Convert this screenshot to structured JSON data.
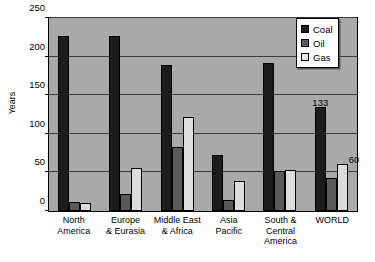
{
  "chart_data": {
    "type": "bar",
    "title": "",
    "xlabel": "",
    "ylabel": "Years",
    "ylim": [
      0,
      250
    ],
    "yticks": [
      0,
      50,
      100,
      150,
      200,
      250
    ],
    "grid": true,
    "legend_position": "top-right",
    "categories": [
      "North America",
      "Europe & Eurasia",
      "Middle East & Africa",
      "Asia Pacific",
      "South & Central America",
      "WORLD"
    ],
    "category_lines": [
      [
        "North",
        "America"
      ],
      [
        "Europe",
        "& Eurasia"
      ],
      [
        "Middle East",
        "& Africa"
      ],
      [
        "Asia",
        "Pacific"
      ],
      [
        "South &",
        "Central",
        "America"
      ],
      [
        "WORLD"
      ]
    ],
    "series": [
      {
        "name": "Coal",
        "color": "#1c1c1c",
        "values": [
          225,
          225,
          187,
          72,
          190,
          133
        ],
        "labels": [
          "",
          "",
          "",
          "",
          "",
          "133"
        ]
      },
      {
        "name": "Oil",
        "color": "#595959",
        "values": [
          12,
          22,
          82,
          14,
          51,
          42
        ],
        "labels": [
          "",
          "",
          "",
          "",
          "",
          "42"
        ]
      },
      {
        "name": "Gas",
        "color": "#dcdcdc",
        "values": [
          10,
          55,
          120,
          38,
          53,
          60
        ],
        "labels": [
          "",
          "",
          "",
          "",
          "",
          "60"
        ]
      }
    ],
    "colors": {
      "plot_background": "#a9a9a9",
      "page_background": "#ffffff",
      "axis": "#000000",
      "gridline": "#3a3a3a"
    }
  }
}
